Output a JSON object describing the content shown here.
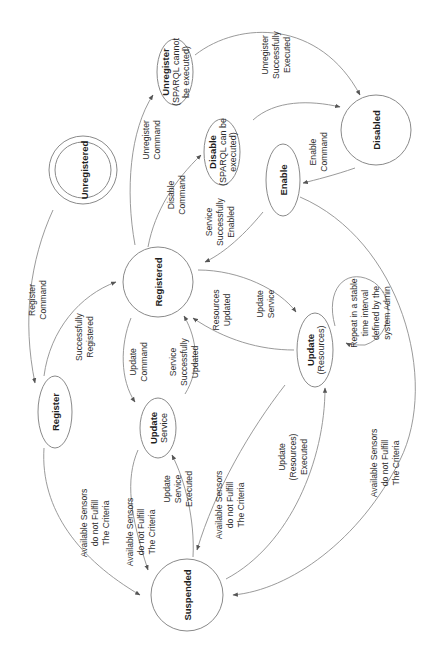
{
  "diagram": {
    "orientation": "rotated-90-ccw",
    "colors": {
      "line": "#8f8f8f",
      "node_border": "#8a8a8a",
      "text": "#1e1e1e",
      "background": "#ffffff"
    },
    "nodes": {
      "unregistered": {
        "title": "Unregistered",
        "shape": "double-circle"
      },
      "unregister": {
        "title": "Unregister",
        "line1": "(SPARQL cannot",
        "line2": "be executed)",
        "shape": "ellipse"
      },
      "disable": {
        "title": "Disable",
        "line1": "(SPARQL can be",
        "line2": "executed)",
        "shape": "ellipse"
      },
      "disabled": {
        "title": "Disabled",
        "shape": "circle"
      },
      "enable": {
        "title": "Enable",
        "shape": "ellipse"
      },
      "registered": {
        "title": "Registered",
        "shape": "circle"
      },
      "register": {
        "title": "Register",
        "shape": "ellipse"
      },
      "update_service": {
        "title": "Update",
        "line1": "Service",
        "shape": "ellipse"
      },
      "update_resources": {
        "title": "Update",
        "line1": "(Resources)",
        "shape": "ellipse"
      },
      "suspended": {
        "title": "Suspended",
        "shape": "circle"
      }
    },
    "edges": {
      "register_command": {
        "from": "Unregistered",
        "to": "Register",
        "lines": [
          "Register",
          "Command"
        ]
      },
      "successfully_registered": {
        "from": "Register",
        "to": "Registered",
        "lines": [
          "Successfully",
          "Registered"
        ]
      },
      "unregister_command": {
        "from": "Registered",
        "to": "Unregister",
        "lines": [
          "Unregister",
          "Command"
        ]
      },
      "unregister_executed": {
        "from": "Unregister",
        "to": "Disabled",
        "lines": [
          "Unregister",
          "Successfully",
          "Executed"
        ]
      },
      "disable_command": {
        "from": "Registered",
        "to": "Disable",
        "lines": [
          "Disable",
          "Command"
        ]
      },
      "disable_to_disabled": {
        "from": "Disable",
        "to": "Disabled",
        "lines": []
      },
      "enable_command": {
        "from": "Disabled",
        "to": "Enable",
        "lines": [
          "Enable",
          "Command"
        ]
      },
      "service_enabled": {
        "from": "Enable",
        "to": "Registered",
        "lines": [
          "Service",
          "Successfully",
          "Enabled"
        ]
      },
      "update_command": {
        "from": "Registered",
        "to": "Update Service",
        "lines": [
          "Update",
          "Command"
        ]
      },
      "service_updated": {
        "from": "Update Service",
        "to": "Registered",
        "lines": [
          "Service",
          "Successfully",
          "Updated"
        ]
      },
      "resources_updated": {
        "from": "Update (Resources)",
        "to": "Registered",
        "lines": [
          "Resources",
          "Updated"
        ]
      },
      "update_service_edge": {
        "from": "Registered",
        "to": "Update (Resources)",
        "lines": [
          "Update",
          "Service"
        ]
      },
      "repeat_loop": {
        "from": "Update (Resources)",
        "to": "Update (Resources)",
        "lines": [
          "Repeat in a stable",
          "time interval",
          "defined by the",
          "system Admin"
        ]
      },
      "register_to_suspended": {
        "from": "Register",
        "to": "Suspended",
        "lines": [
          "Available Sensors",
          "do not Fulfill",
          "The Criteria"
        ]
      },
      "update_service_to_suspended": {
        "from": "Update Service",
        "to": "Suspended",
        "lines": [
          "Available Sensors",
          "do not Fulfill",
          "The Criteria"
        ]
      },
      "update_service_executed": {
        "from": "Suspended",
        "to": "Update Service",
        "lines": [
          "Update",
          "Service",
          "Executed"
        ]
      },
      "resources_to_suspended": {
        "from": "Update (Resources)",
        "to": "Suspended",
        "lines": [
          "Available Sensors",
          "do not Fulfill",
          "The Criteria"
        ]
      },
      "resources_executed": {
        "from": "Suspended",
        "to": "Update (Resources)",
        "lines": [
          "Update",
          "(Resources)",
          "Executed"
        ]
      },
      "enable_to_suspended": {
        "from": "Enable",
        "to": "Suspended",
        "lines": [
          "Available Sensors",
          "do not Fulfill",
          "The Criteria"
        ]
      }
    }
  }
}
